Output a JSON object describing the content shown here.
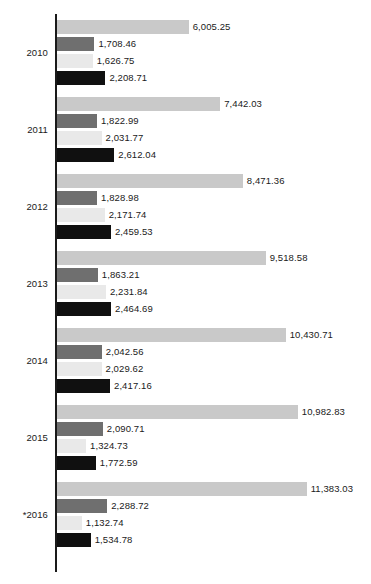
{
  "chart_data": {
    "type": "bar",
    "orientation": "horizontal",
    "title": "",
    "subtitle": "",
    "xlabel": "",
    "ylabel": "",
    "grid": false,
    "legend_position": "none",
    "axis_line_color": "#1a1a1a",
    "xlim": [
      0,
      11383.03
    ],
    "categories": [
      "2010",
      "2011",
      "2012",
      "2013",
      "2014",
      "2015",
      "*2016"
    ],
    "series": [
      {
        "name": "series-1",
        "color": "#c9c9c9",
        "values": [
          6005.25,
          7442.03,
          8471.36,
          9518.58,
          10430.71,
          10982.83,
          11383.03
        ],
        "labels": [
          "6,005.25",
          "7,442.03",
          "8,471.36",
          "9,518.58",
          "10,430.71",
          "10,982.83",
          "11,383.03"
        ]
      },
      {
        "name": "series-2",
        "color": "#6f6f6f",
        "values": [
          1708.46,
          1822.99,
          1828.98,
          1863.21,
          2042.56,
          2090.71,
          2288.72
        ],
        "labels": [
          "1,708.46",
          "1,822.99",
          "1,828.98",
          "1,863.21",
          "2,042.56",
          "2,090.71",
          "2,288.72"
        ]
      },
      {
        "name": "series-3",
        "color": "#e9e9e9",
        "values": [
          1626.75,
          2031.77,
          2171.74,
          2231.84,
          2029.62,
          1324.73,
          1132.74
        ],
        "labels": [
          "1,626.75",
          "2,031.77",
          "2,171.74",
          "2,231.84",
          "2,029.62",
          "1,324.73",
          "1,132.74"
        ]
      },
      {
        "name": "series-4",
        "color": "#101010",
        "values": [
          2208.71,
          2612.04,
          2459.53,
          2464.69,
          2417.16,
          1772.59,
          1534.78
        ],
        "labels": [
          "2,208.71",
          "2,612.04",
          "2,459.53",
          "2,464.69",
          "2,417.16",
          "1,772.59",
          "1,534.78"
        ]
      }
    ]
  },
  "layout": {
    "axis_x": 55,
    "bar_start_x": 57,
    "plot_top": 20,
    "bar_height": 14,
    "bar_gap": 3,
    "group_gap": 12,
    "px_per_unit": 0.02193
  }
}
